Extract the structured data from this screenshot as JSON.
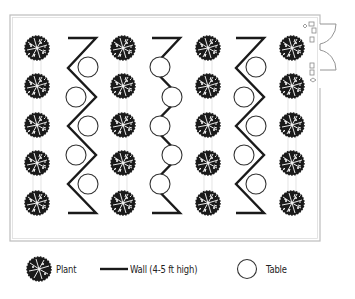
{
  "diagram": {
    "type": "floor-plan",
    "colors": {
      "ink": "#1a1a1a",
      "border": "#bbbbbb",
      "background": "#ffffff"
    },
    "room": {
      "x": 10,
      "y": 15,
      "width": 310,
      "height": 226
    },
    "plant_columns_x": [
      37,
      123,
      208,
      292
    ],
    "wall_columns_x": [
      82,
      165,
      250
    ],
    "row_y": [
      48,
      86,
      125,
      163,
      203
    ],
    "plants_per_column": 5,
    "tables_per_wall": 5,
    "doors": {
      "side": "right",
      "count": 2,
      "type": "double-swing"
    }
  },
  "legend": {
    "plant_label": "Plant",
    "wall_label": "Wall (4-5 ft high)",
    "table_label": "Table"
  }
}
